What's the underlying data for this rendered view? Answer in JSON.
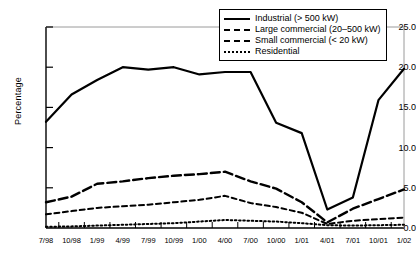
{
  "chart_data": {
    "type": "line",
    "title": "",
    "xlabel": "",
    "ylabel": "Percentage",
    "ylim": [
      0.0,
      25.0
    ],
    "yticks": [
      "0.0",
      "5.0",
      "10.0",
      "15.0",
      "20.0",
      "25.0"
    ],
    "ytick_values": [
      0.0,
      5.0,
      10.0,
      15.0,
      20.0,
      25.0
    ],
    "grid": false,
    "legend_position": "top-right",
    "categories": [
      "7/98",
      "10/98",
      "1/99",
      "4/99",
      "7/99",
      "10/99",
      "1/00",
      "4/00",
      "7/00",
      "10/00",
      "1/01",
      "4/01",
      "7/01",
      "10/01",
      "1/02"
    ],
    "series": [
      {
        "name": "Industrial (> 500 kW)",
        "style": "solid",
        "color": "#000000",
        "values": [
          13.2,
          16.6,
          18.4,
          20.0,
          19.7,
          20.0,
          19.1,
          19.4,
          19.4,
          13.1,
          11.8,
          2.3,
          3.8,
          15.9,
          19.8
        ]
      },
      {
        "name": "Large commercial (20–500 kW)",
        "style": "long-dash",
        "color": "#000000",
        "values": [
          3.2,
          3.9,
          5.5,
          5.8,
          6.2,
          6.5,
          6.7,
          7.0,
          5.8,
          4.9,
          3.2,
          0.7,
          2.4,
          3.6,
          4.8
        ]
      },
      {
        "name": "Small commercial (< 20 kW)",
        "style": "short-dash",
        "color": "#000000",
        "values": [
          1.7,
          2.1,
          2.5,
          2.7,
          2.9,
          3.2,
          3.5,
          4.0,
          3.1,
          2.6,
          1.9,
          0.5,
          0.9,
          1.1,
          1.3
        ]
      },
      {
        "name": "Residential",
        "style": "dotted",
        "color": "#000000",
        "values": [
          0.15,
          0.2,
          0.3,
          0.4,
          0.5,
          0.6,
          0.8,
          1.0,
          0.9,
          0.8,
          0.6,
          0.35,
          0.3,
          0.35,
          0.4
        ]
      }
    ]
  }
}
